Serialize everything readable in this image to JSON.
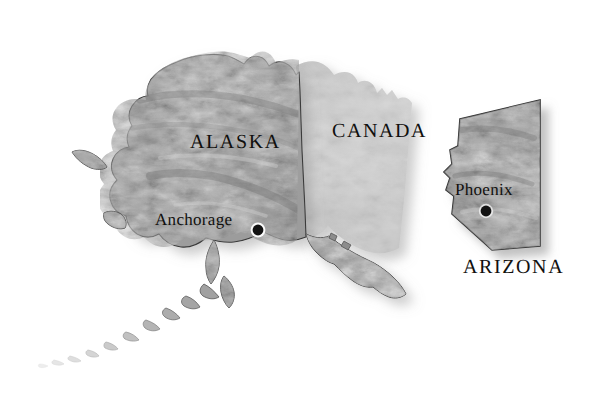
{
  "map": {
    "title": "Alaska and Arizona reference map",
    "background_color": "#ffffff",
    "terrain_color": "#a9a9a9",
    "canada_fill_color": "#d2d2d2",
    "outline_color": "#2b2b2b",
    "label_color": "#11100e",
    "regions": [
      {
        "name": "ALASKA",
        "label": "ALASKA",
        "type": "state",
        "label_x": 190,
        "label_y": 131
      },
      {
        "name": "CANADA",
        "label": "CANADA",
        "type": "country",
        "label_x": 332,
        "label_y": 120
      },
      {
        "name": "ARIZONA",
        "label": "ARIZONA",
        "type": "state",
        "label_x": 463,
        "label_y": 256
      }
    ],
    "cities": [
      {
        "name": "Anchorage",
        "label": "Anchorage",
        "region": "ALASKA",
        "label_x": 155,
        "label_y": 210,
        "marker_x": 258,
        "marker_y": 230,
        "marker_radius": 5.4,
        "marker_style": "filled-circle"
      },
      {
        "name": "Phoenix",
        "label": "Phoenix",
        "region": "ARIZONA",
        "label_x": 455,
        "label_y": 180,
        "marker_x": 486,
        "marker_y": 211,
        "marker_radius": 5.4,
        "marker_style": "filled-circle"
      }
    ]
  }
}
